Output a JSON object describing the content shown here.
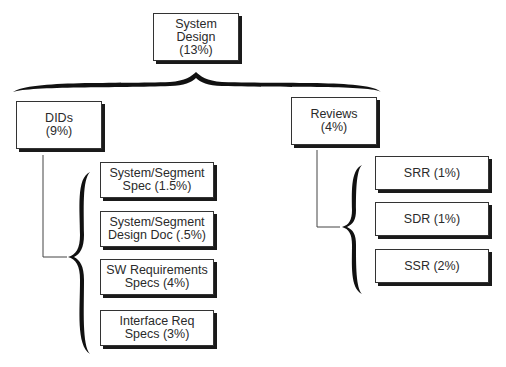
{
  "diagram": {
    "root": {
      "label": "System\nDesign\n(13%)"
    },
    "branches": [
      {
        "label": "DIDs\n(9%)",
        "children": [
          {
            "label": "System/Segment\nSpec (1.5%)"
          },
          {
            "label": "System/Segment\nDesign Doc (.5%)"
          },
          {
            "label": "SW Requirements\nSpecs (4%)"
          },
          {
            "label": "Interface Req\nSpecs (3%)"
          }
        ]
      },
      {
        "label": "Reviews\n(4%)",
        "children": [
          {
            "label": "SRR (1%)"
          },
          {
            "label": "SDR (1%)"
          },
          {
            "label": "SSR (2%)"
          }
        ]
      }
    ]
  }
}
